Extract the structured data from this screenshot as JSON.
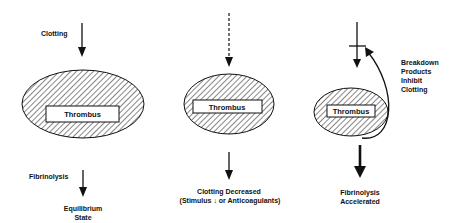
{
  "panels": [
    {
      "id": "equilibrium",
      "top_label": "Clotting",
      "center_label": "Thrombus",
      "bottom_label": "Fibrinolysis",
      "result_line1": "Equilibrium",
      "result_line2": "State"
    },
    {
      "id": "clotting-decreased",
      "center_label": "Thrombus",
      "result_line1": "Clotting Decreased",
      "result_line2": "(Stimulus ↓ or Anticoagulants)"
    },
    {
      "id": "fibrinolysis-accelerated",
      "center_label": "Thrombus",
      "feedback_line1": "Breakdown",
      "feedback_line2": "Products",
      "feedback_line3": "Inhibit",
      "feedback_line4": "Clotting",
      "result_line1": "Fibrinolysis",
      "result_line2": "Accelerated"
    }
  ],
  "colors": {
    "ink": "#111111",
    "background": "#ffffff"
  }
}
